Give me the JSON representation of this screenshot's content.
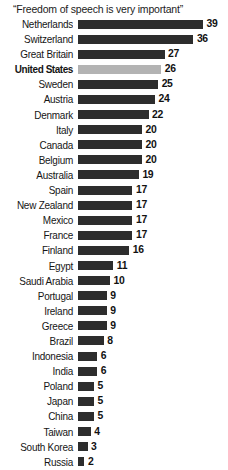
{
  "chart_data": {
    "type": "bar",
    "title": "“Freedom of speech is very important”",
    "xlabel": "",
    "ylabel": "",
    "orientation": "horizontal",
    "grid": false,
    "legend": false,
    "xlim": [
      0,
      39
    ],
    "highlight_category": "United States",
    "colors": {
      "bar": "#2d2d2d",
      "bar_highlight": "#b3b3b3",
      "background": "#ffffff",
      "text": "#111111"
    },
    "categories": [
      "Netherlands",
      "Switzerland",
      "Great Britain",
      "United States",
      "Sweden",
      "Austria",
      "Denmark",
      "Italy",
      "Canada",
      "Belgium",
      "Australia",
      "Spain",
      "New Zealand",
      "Mexico",
      "France",
      "Finland",
      "Egypt",
      "Saudi Arabia",
      "Portugal",
      "Ireland",
      "Greece",
      "Brazil",
      "Indonesia",
      "India",
      "Poland",
      "Japan",
      "China",
      "Taiwan",
      "South Korea",
      "Russia"
    ],
    "values": [
      39,
      36,
      27,
      26,
      25,
      24,
      22,
      20,
      20,
      20,
      19,
      17,
      17,
      17,
      17,
      16,
      11,
      10,
      9,
      9,
      9,
      8,
      6,
      6,
      5,
      5,
      5,
      4,
      3,
      2
    ]
  }
}
